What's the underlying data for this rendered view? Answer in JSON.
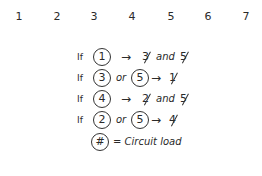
{
  "number_row": [
    "1",
    "2",
    "3",
    "4",
    "5",
    "6",
    "7"
  ],
  "rules": [
    {
      "prefix": "If",
      "inputs": [
        "1"
      ],
      "connector": "",
      "arrow": "→",
      "outputs": [
        "3",
        "5"
      ],
      "joiner": "and"
    },
    {
      "prefix": "If",
      "inputs": [
        "3",
        "5"
      ],
      "connector": "or",
      "arrow": "→",
      "outputs": [
        "1"
      ],
      "joiner": ""
    },
    {
      "prefix": "If",
      "inputs": [
        "4"
      ],
      "connector": "",
      "arrow": "→",
      "outputs": [
        "2",
        "5"
      ],
      "joiner": "and"
    },
    {
      "prefix": "If",
      "inputs": [
        "2",
        "5"
      ],
      "connector": "or",
      "arrow": "→",
      "outputs": [
        "4"
      ],
      "joiner": ""
    }
  ],
  "legend": {
    "symbol": "#",
    "text": "= Circuit load"
  }
}
